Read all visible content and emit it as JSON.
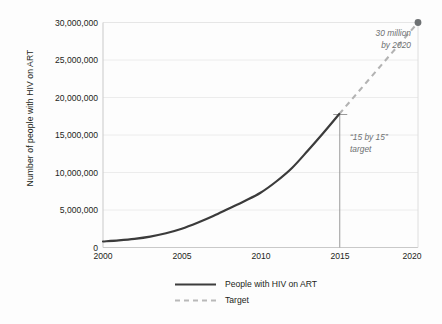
{
  "chart_data": {
    "type": "line",
    "title": "",
    "xlabel": "",
    "ylabel": "Number of people with HIV on ART",
    "xlim": [
      2000,
      2020
    ],
    "ylim": [
      0,
      30000000
    ],
    "grid": true,
    "xticks": [
      "2000",
      "2005",
      "2010",
      "2015",
      "2020"
    ],
    "xtick_values": [
      2000,
      2005,
      2010,
      2015,
      2020
    ],
    "yticks": [
      "0",
      "5,000,000",
      "10,000,000",
      "15,000,000",
      "20,000,000",
      "25,000,000",
      "30,000,000"
    ],
    "ytick_values": [
      0,
      5000000,
      10000000,
      15000000,
      20000000,
      25000000,
      30000000
    ],
    "legend_position": "bottom",
    "series": [
      {
        "name": "People with HIV on ART",
        "style": "solid",
        "color": "#3b3b3b",
        "x": [
          2000,
          2001,
          2002,
          2003,
          2004,
          2005,
          2006,
          2007,
          2008,
          2009,
          2010,
          2011,
          2012,
          2013,
          2014,
          2015
        ],
        "values": [
          800000,
          950000,
          1150000,
          1450000,
          1900000,
          2500000,
          3300000,
          4200000,
          5200000,
          6200000,
          7300000,
          8800000,
          10600000,
          12900000,
          15300000,
          17800000
        ]
      },
      {
        "name": "Target",
        "style": "dashed",
        "color": "#b3b3b3",
        "x": [
          2015,
          2020
        ],
        "values": [
          17800000,
          30000000
        ]
      }
    ],
    "markers": [
      {
        "name": "target-endpoint",
        "x": 2020,
        "y": 30000000,
        "color": "#6e7173"
      }
    ],
    "annotations": [
      {
        "name": "thirty-million-label",
        "text": "30 million\nby 2020",
        "x": 2017.2,
        "y": 27800000
      },
      {
        "name": "fifteen-by-fifteen-label",
        "text": "“15 by 15”\ntarget",
        "x": 2015.9,
        "y": 15600000
      },
      {
        "name": "target-bracket",
        "text": "",
        "x": 2015,
        "y_from": 0,
        "y_to": 17800000
      }
    ]
  },
  "legend": {
    "items": [
      {
        "label": "People with HIV on ART",
        "style": "solid"
      },
      {
        "label": "Target",
        "style": "dashed"
      }
    ]
  },
  "colors": {
    "series_solid": "#3b3b3b",
    "series_dashed": "#b3b3b3",
    "grid": "#e8e8e8",
    "axis": "#bdbdbd",
    "annotation_text": "#6e7173",
    "tick_text": "#231f20",
    "background": "#fdfdfd"
  }
}
